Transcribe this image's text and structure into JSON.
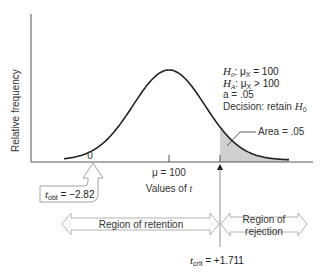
{
  "diagram": {
    "y_axis_label": "Relative frequency",
    "x_axis_label_prefix": "Values of ",
    "x_axis_label_var": "t",
    "tick_zero": "0",
    "tick_mu": "μ = 100",
    "hypotheses": {
      "h0_sym": "H",
      "h0_sub": "0",
      "h0_rest": ": μ",
      "h0_sub2": "X",
      "h0_val": " = 100",
      "ha_sym": "H",
      "ha_sub": "A",
      "ha_rest": ": μ",
      "ha_sub2": "X",
      "ha_val": " > 100",
      "alpha": "a = .05",
      "decision_text": "Decision: retain ",
      "decision_sym": "H",
      "decision_sub": "0"
    },
    "area_label": "Area = .05",
    "t_obt": {
      "sym": "t",
      "sub": "obt",
      "value": " = −2.82"
    },
    "t_crit": {
      "sym": "t",
      "sub": "crit",
      "value": " = +1.711"
    },
    "region_retention": "Region of retention",
    "region_rejection_line1": "Region of",
    "region_rejection_line2": "rejection",
    "colors": {
      "curve": "#222222",
      "shade": "#c8c8c8",
      "arrow_outline": "#999999",
      "axis": "#555555"
    }
  }
}
